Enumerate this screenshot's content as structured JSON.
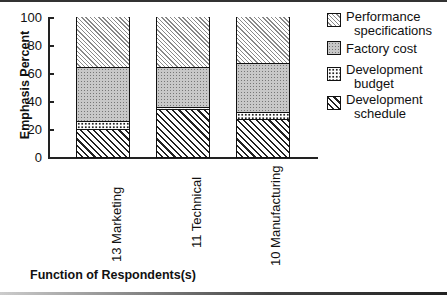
{
  "chart_data": {
    "type": "bar",
    "stacked": true,
    "title": "",
    "xlabel": "Function of Respondents(s)",
    "ylabel": "Emphasis Percent",
    "ylim": [
      0,
      100
    ],
    "yticks": [
      "0",
      "20",
      "40",
      "60",
      "80",
      "100"
    ],
    "categories": [
      "13 Marketing",
      "11 Technical",
      "10 Manufacturing"
    ],
    "series": [
      {
        "name": "Development schedule",
        "values": [
          20,
          34,
          27
        ]
      },
      {
        "name": "Development budget",
        "values": [
          6,
          2,
          5
        ]
      },
      {
        "name": "Factory cost",
        "values": [
          38,
          28,
          35
        ]
      },
      {
        "name": "Performance specifications",
        "values": [
          36,
          36,
          33
        ]
      }
    ],
    "legend": [
      {
        "line1": "Performance",
        "line2": "specifications",
        "pattern": "perf"
      },
      {
        "line1": "Factory cost",
        "line2": "",
        "pattern": "factory"
      },
      {
        "line1": "Development",
        "line2": "budget",
        "pattern": "budget"
      },
      {
        "line1": "Development",
        "line2": "schedule",
        "pattern": "sched"
      }
    ],
    "legend_position": "right",
    "grid": false
  }
}
